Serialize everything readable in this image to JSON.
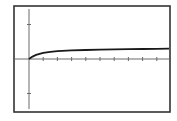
{
  "chart_data": {
    "type": "line",
    "title": "",
    "xlabel": "",
    "ylabel": "",
    "grid": false,
    "legend": null,
    "frame": {
      "left": 14,
      "top": 6,
      "right": 170,
      "bottom": 112
    },
    "origin_px": {
      "x": 29,
      "y": 59
    },
    "x_tick_spacing_px": 14.2,
    "x_ticks_count": 9,
    "y_tick_spacing_px": 34.5,
    "y_ticks_count": 2,
    "xlim": [
      -1,
      10
    ],
    "ylim": [
      -1.5,
      1.5
    ],
    "series": [
      {
        "name": "curve",
        "description": "saturating growth curve starting at origin, asymptotically approaching ~0.3",
        "x": [
          0,
          0.25,
          0.5,
          1,
          1.5,
          2,
          3,
          4,
          5,
          6,
          7,
          8,
          9,
          10
        ],
        "y": [
          0,
          0.07,
          0.12,
          0.18,
          0.21,
          0.23,
          0.25,
          0.26,
          0.27,
          0.28,
          0.285,
          0.29,
          0.295,
          0.3
        ]
      }
    ],
    "colors": {
      "line": "#1a1a1a",
      "axis": "#6a6a6a",
      "frame": "#333333",
      "background": "#ffffff"
    }
  }
}
